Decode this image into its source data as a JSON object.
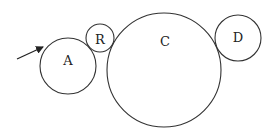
{
  "diagram": {
    "type": "tangent-circles",
    "circles": [
      {
        "id": "A",
        "label": "A",
        "cx": 68,
        "cy": 66,
        "r": 28
      },
      {
        "id": "B",
        "label": "R",
        "cx": 100,
        "cy": 38,
        "r": 14
      },
      {
        "id": "C",
        "label": "C",
        "cx": 164,
        "cy": 70,
        "r": 57
      },
      {
        "id": "D",
        "label": "D",
        "cx": 238,
        "cy": 38,
        "r": 23
      }
    ],
    "arrow": {
      "x1": 17,
      "y1": 59,
      "x2": 44,
      "y2": 47,
      "points_to": "A"
    },
    "colors": {
      "stroke": "#333333",
      "background": "#ffffff"
    }
  }
}
